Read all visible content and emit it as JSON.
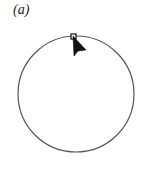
{
  "figure": {
    "label": "(a)",
    "circle": {
      "cx": 76,
      "cy": 94,
      "r": 58,
      "stroke": "#555555"
    },
    "handle": {
      "x": 71,
      "y": 34,
      "size": 5
    },
    "cursor": {
      "icon": "arrow-cursor-icon",
      "x": 73,
      "y": 36,
      "color": "#111111"
    }
  }
}
